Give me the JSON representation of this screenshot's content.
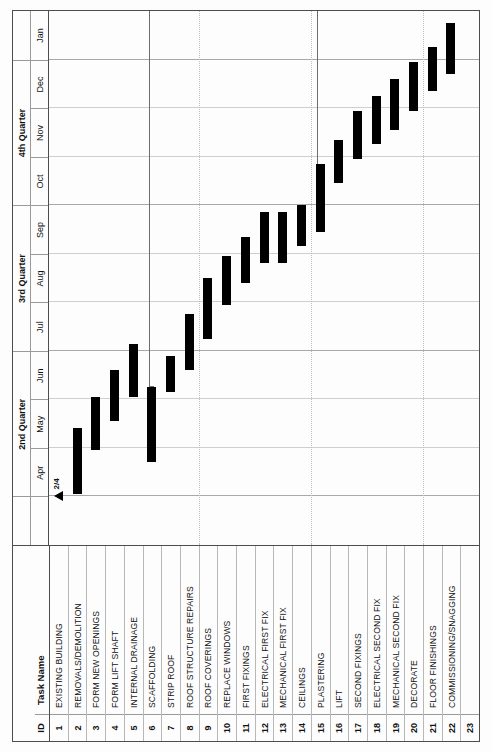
{
  "document": {
    "kind": "gantt-chart",
    "orientation": "landscape-rotated"
  },
  "table": {
    "columns": [
      {
        "key": "id",
        "label": "ID"
      },
      {
        "key": "name",
        "label": "Task Name"
      }
    ]
  },
  "timescale": {
    "quarters": [
      {
        "label": "",
        "span": 1
      },
      {
        "label": "2nd Quarter",
        "span": 3
      },
      {
        "label": "3rd Quarter",
        "span": 3
      },
      {
        "label": "4th Quarter",
        "span": 3
      },
      {
        "label": "",
        "span": 1
      }
    ],
    "months": [
      "",
      "Apr",
      "May",
      "Jun",
      "Jul",
      "Aug",
      "Sep",
      "Oct",
      "Nov",
      "Dec",
      "Jan"
    ]
  },
  "milestone": {
    "label": "2/4",
    "row": 1
  },
  "chart_data": {
    "type": "bar",
    "title": "",
    "xlabel": "",
    "ylabel": "",
    "orientation": "horizontal-gantt",
    "categories": [
      "EXISTING BUILDING",
      "REMOVALS/DEMOLITION",
      "FORM NEW OPENINGS",
      "FORM LIFT SHAFT",
      "INTERNAL DRAINAGE",
      "SCAFFOLDING",
      "STRIP ROOF",
      "ROOF STRUCTURE REPAIRS",
      "ROOF COVERINGS",
      "REPLACE WINDOWS",
      "FIRST FIXINGS",
      "ELECTRICAL FIRST FIX",
      "MECHANICAL FIRST FIX",
      "CEILINGS",
      "PLASTERING",
      "LIFT",
      "SECOND FIXINGS",
      "ELECTRICAL SECOND FIX",
      "MECHANICAL SECOND FIX",
      "DECORATE",
      "FLOOR FINISHINGS",
      "COMMISSIONING/SNAGGING",
      ""
    ],
    "xlim": [
      "Mar",
      "Jan"
    ],
    "grid": true,
    "legend": false,
    "rows": [
      {
        "id": "1",
        "name": "EXISTING BUILDING",
        "kind": "milestone",
        "start": 0.0,
        "end": 0.0
      },
      {
        "id": "2",
        "name": "REMOVALS/DEMOLITION",
        "kind": "task",
        "start": 0.05,
        "end": 1.4
      },
      {
        "id": "3",
        "name": "FORM NEW OPENINGS",
        "kind": "task",
        "start": 0.95,
        "end": 2.05
      },
      {
        "id": "4",
        "name": "FORM LIFT SHAFT",
        "kind": "task",
        "start": 1.55,
        "end": 2.6
      },
      {
        "id": "5",
        "name": "INTERNAL DRAINAGE",
        "kind": "task",
        "start": 2.05,
        "end": 3.15
      },
      {
        "id": "6",
        "name": "SCAFFOLDING",
        "kind": "task",
        "start": 0.7,
        "end": 2.25
      },
      {
        "id": "7",
        "name": "STRIP ROOF",
        "kind": "task",
        "start": 2.15,
        "end": 2.9
      },
      {
        "id": "8",
        "name": "ROOF STRUCTURE REPAIRS",
        "kind": "task",
        "start": 2.6,
        "end": 3.75
      },
      {
        "id": "9",
        "name": "ROOF COVERINGS",
        "kind": "task",
        "start": 3.25,
        "end": 4.5
      },
      {
        "id": "10",
        "name": "REPLACE WINDOWS",
        "kind": "task",
        "start": 3.95,
        "end": 4.95
      },
      {
        "id": "11",
        "name": "FIRST FIXINGS",
        "kind": "task",
        "start": 4.4,
        "end": 5.35
      },
      {
        "id": "12",
        "name": "ELECTRICAL FIRST FIX",
        "kind": "task",
        "start": 4.8,
        "end": 5.85
      },
      {
        "id": "13",
        "name": "MECHANICAL FIRST FIX",
        "kind": "task",
        "start": 4.8,
        "end": 5.85
      },
      {
        "id": "14",
        "name": "CEILINGS",
        "kind": "task",
        "start": 5.15,
        "end": 6.0
      },
      {
        "id": "15",
        "name": "PLASTERING",
        "kind": "task",
        "start": 5.45,
        "end": 6.85
      },
      {
        "id": "16",
        "name": "LIFT",
        "kind": "task",
        "start": 6.45,
        "end": 7.35
      },
      {
        "id": "17",
        "name": "SECOND FIXINGS",
        "kind": "task",
        "start": 6.95,
        "end": 7.95
      },
      {
        "id": "18",
        "name": "ELECTRICAL SECOND FIX",
        "kind": "task",
        "start": 7.25,
        "end": 8.25
      },
      {
        "id": "19",
        "name": "MECHANICAL SECOND FIX",
        "kind": "task",
        "start": 7.55,
        "end": 8.6
      },
      {
        "id": "20",
        "name": "DECORATE",
        "kind": "task",
        "start": 7.95,
        "end": 8.95
      },
      {
        "id": "21",
        "name": "FLOOR FINISHINGS",
        "kind": "task",
        "start": 8.35,
        "end": 9.25
      },
      {
        "id": "22",
        "name": "COMMISSIONING/SNAGGING",
        "kind": "task",
        "start": 8.7,
        "end": 9.75
      },
      {
        "id": "23",
        "name": "",
        "kind": "empty",
        "start": 0,
        "end": 0
      }
    ],
    "summary_links": [
      {
        "from_row": 6,
        "start": 2.25,
        "end": 10.0
      },
      {
        "from_row": 15,
        "start": 6.0,
        "end": 10.0
      }
    ]
  }
}
